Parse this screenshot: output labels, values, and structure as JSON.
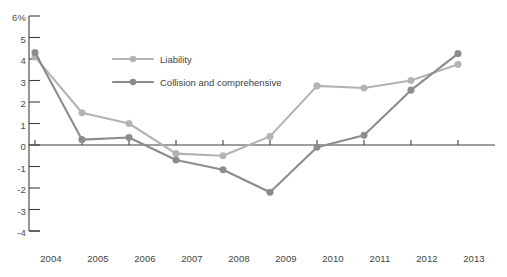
{
  "chart_data": {
    "type": "line",
    "title": "",
    "subtitle": "",
    "xlabel": "",
    "ylabel": "",
    "categories": [
      "2004",
      "2005",
      "2006",
      "2007",
      "2008",
      "2009",
      "2010",
      "2011",
      "2012",
      "2013"
    ],
    "x": [
      2004,
      2005,
      2006,
      2007,
      2008,
      2009,
      2010,
      2011,
      2012,
      2013
    ],
    "series": [
      {
        "name": "Liability",
        "color": "#b3b3b3",
        "values": [
          4.1,
          1.5,
          1.0,
          -0.4,
          -0.5,
          0.4,
          2.75,
          2.65,
          3.0,
          3.75
        ]
      },
      {
        "name": "Collision and comprehensive",
        "color": "#8c8c8c",
        "values": [
          4.3,
          0.25,
          0.35,
          -0.7,
          -1.15,
          -2.2,
          -0.1,
          0.45,
          2.55,
          4.25
        ]
      }
    ],
    "ylim": [
      -4,
      6
    ],
    "yticks": [
      6,
      5,
      4,
      3,
      2,
      1,
      0,
      -1,
      -2,
      -3,
      -4
    ],
    "ytick_labels": [
      "6%",
      "5",
      "4",
      "3",
      "2",
      "1",
      "0",
      "-1",
      "-2",
      "-3",
      "-4"
    ],
    "grid": false,
    "legend_position": "inside-upper-left",
    "zero_line": true,
    "markers": "circle"
  },
  "axes": {
    "y_ticks": [
      {
        "label": "6%",
        "value": 6
      },
      {
        "label": "5",
        "value": 5
      },
      {
        "label": "4",
        "value": 4
      },
      {
        "label": "3",
        "value": 3
      },
      {
        "label": "2",
        "value": 2
      },
      {
        "label": "1",
        "value": 1
      },
      {
        "label": "0",
        "value": 0
      },
      {
        "label": "-1",
        "value": -1
      },
      {
        "label": "-2",
        "value": -2
      },
      {
        "label": "-3",
        "value": -3
      },
      {
        "label": "-4",
        "value": -4
      }
    ],
    "x_ticks": [
      {
        "label": "2004",
        "value": 2004
      },
      {
        "label": "2005",
        "value": 2005
      },
      {
        "label": "2006",
        "value": 2006
      },
      {
        "label": "2007",
        "value": 2007
      },
      {
        "label": "2008",
        "value": 2008
      },
      {
        "label": "2009",
        "value": 2009
      },
      {
        "label": "2010",
        "value": 2010
      },
      {
        "label": "2011",
        "value": 2011
      },
      {
        "label": "2012",
        "value": 2012
      },
      {
        "label": "2013",
        "value": 2013
      }
    ]
  },
  "legend": {
    "entries": [
      {
        "label": "Liability",
        "color": "#b3b3b3"
      },
      {
        "label": "Collision and comprehensive",
        "color": "#8c8c8c"
      }
    ]
  },
  "colors": {
    "liability": "#b3b3b3",
    "collision": "#8c8c8c",
    "axis": "#3f3f3f",
    "tick_text": "#4d4d4d",
    "background": "#ffffff"
  }
}
